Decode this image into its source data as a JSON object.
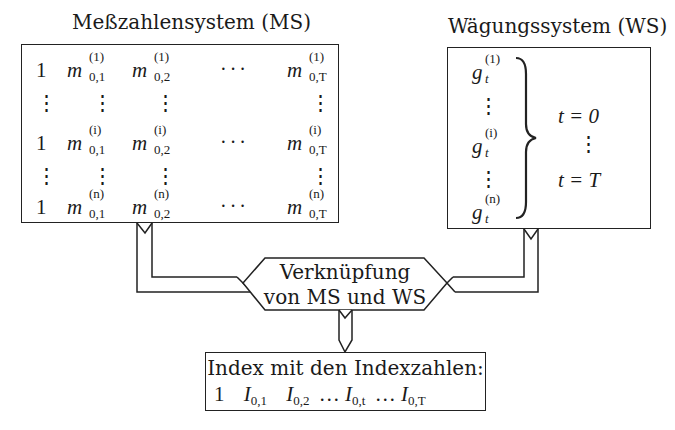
{
  "ms": {
    "title": "Meßzahlensystem (MS)",
    "rows": [
      {
        "first": "1",
        "sup": "(1)",
        "c1": "0,1",
        "c2": "0,2",
        "dots": "···",
        "cT": "0,T"
      },
      {
        "first": "1",
        "sup": "(i)",
        "c1": "0,1",
        "c2": "0,2",
        "dots": "···",
        "cT": "0,T"
      },
      {
        "first": "1",
        "sup": "(n)",
        "c1": "0,1",
        "c2": "0,2",
        "dots": "···",
        "cT": "0,T"
      }
    ],
    "symbol": "m",
    "vdots": "⋮"
  },
  "ws": {
    "title": "Wägungssystem (WS)",
    "symbol": "g",
    "sub": "t",
    "sups": [
      "(1)",
      "(i)",
      "(n)"
    ],
    "vdots": "⋮",
    "range_start": "t = 0",
    "range_end": "t = T"
  },
  "merge": {
    "line1": "Verknüpfung",
    "line2": "von MS und WS"
  },
  "result": {
    "title": "Index mit den Indexzahlen:",
    "first": "1",
    "symbol": "I",
    "subs": [
      "0,1",
      "0,2",
      "0,t",
      "0,T"
    ],
    "dots": "…"
  }
}
